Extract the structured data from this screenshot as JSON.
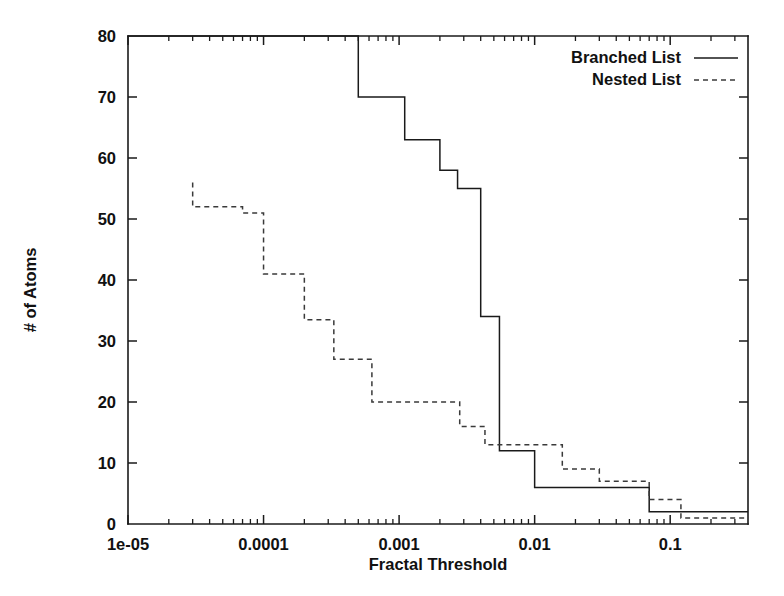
{
  "chart_data": {
    "type": "line",
    "subtype": "step-post",
    "title": "",
    "xlabel": "Fractal Threshold",
    "ylabel": "# of Atoms",
    "xscale": "log",
    "yscale": "linear",
    "xlim": [
      1e-05,
      0.375
    ],
    "ylim": [
      0,
      80
    ],
    "grid": false,
    "legend_position": "top-right",
    "xtick_labels": [
      "1e-05",
      "0.0001",
      "0.001",
      "0.01",
      "0.1"
    ],
    "xtick_values": [
      1e-05,
      0.0001,
      0.001,
      0.01,
      0.1
    ],
    "ytick_labels": [
      "0",
      "10",
      "20",
      "30",
      "40",
      "50",
      "60",
      "70",
      "80"
    ],
    "ytick_values": [
      0,
      10,
      20,
      30,
      40,
      50,
      60,
      70,
      80
    ],
    "series": [
      {
        "name": "Branched List",
        "style": "solid",
        "color": "#1a1a1a",
        "note": "Clipped at top of axis (y=80) for x below 5e-4",
        "points": [
          {
            "x": 1e-05,
            "y": 80
          },
          {
            "x": 0.0005,
            "y": 80
          },
          {
            "x": 0.0005,
            "y": 70
          },
          {
            "x": 0.0011,
            "y": 70
          },
          {
            "x": 0.0011,
            "y": 63
          },
          {
            "x": 0.002,
            "y": 63
          },
          {
            "x": 0.002,
            "y": 58
          },
          {
            "x": 0.0027,
            "y": 58
          },
          {
            "x": 0.0027,
            "y": 55
          },
          {
            "x": 0.004,
            "y": 55
          },
          {
            "x": 0.004,
            "y": 34
          },
          {
            "x": 0.0055,
            "y": 34
          },
          {
            "x": 0.0055,
            "y": 12
          },
          {
            "x": 0.01,
            "y": 12
          },
          {
            "x": 0.01,
            "y": 6
          },
          {
            "x": 0.07,
            "y": 6
          },
          {
            "x": 0.07,
            "y": 2
          },
          {
            "x": 0.375,
            "y": 2
          }
        ]
      },
      {
        "name": "Nested List",
        "style": "dashed",
        "color": "#3a3a3a",
        "points": [
          {
            "x": 3e-05,
            "y": 56
          },
          {
            "x": 3e-05,
            "y": 52
          },
          {
            "x": 7e-05,
            "y": 52
          },
          {
            "x": 7e-05,
            "y": 51
          },
          {
            "x": 0.0001,
            "y": 51
          },
          {
            "x": 0.0001,
            "y": 41
          },
          {
            "x": 0.0002,
            "y": 41
          },
          {
            "x": 0.0002,
            "y": 33.5
          },
          {
            "x": 0.00033,
            "y": 33.5
          },
          {
            "x": 0.00033,
            "y": 27
          },
          {
            "x": 0.00063,
            "y": 27
          },
          {
            "x": 0.00063,
            "y": 20
          },
          {
            "x": 0.0028,
            "y": 20
          },
          {
            "x": 0.0028,
            "y": 16
          },
          {
            "x": 0.0043,
            "y": 16
          },
          {
            "x": 0.0043,
            "y": 13
          },
          {
            "x": 0.016,
            "y": 13
          },
          {
            "x": 0.016,
            "y": 9
          },
          {
            "x": 0.03,
            "y": 9
          },
          {
            "x": 0.03,
            "y": 7
          },
          {
            "x": 0.07,
            "y": 7
          },
          {
            "x": 0.07,
            "y": 4
          },
          {
            "x": 0.12,
            "y": 4
          },
          {
            "x": 0.12,
            "y": 1
          },
          {
            "x": 0.375,
            "y": 1
          }
        ]
      }
    ]
  },
  "legend": {
    "entries": [
      {
        "label": "Branched List",
        "style": "solid"
      },
      {
        "label": "Nested List",
        "style": "dashed"
      }
    ]
  },
  "axes": {
    "x_label": "Fractal Threshold",
    "y_label": "# of Atoms"
  }
}
